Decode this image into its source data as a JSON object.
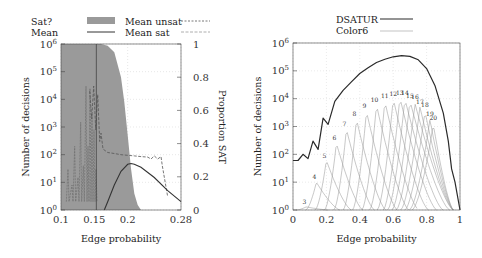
{
  "chart_data": [
    {
      "type": "area",
      "panel": "left",
      "title": "",
      "xlabel": "Edge probability",
      "ylabel": "Number of decisions",
      "ylabel_right": "Proportion SAT",
      "x_ticks": [
        "0.1",
        "0.15",
        "0.2",
        "0.28"
      ],
      "x_tick_values": [
        0.1,
        0.15,
        0.2,
        0.28
      ],
      "xlim": [
        0.1,
        0.28
      ],
      "y_ticks": [
        "10^0",
        "10^1",
        "10^2",
        "10^3",
        "10^4",
        "10^5",
        "10^6"
      ],
      "y_scale": "log",
      "ylim": [
        1,
        1000000
      ],
      "y_right_ticks": [
        "0",
        "0.2",
        "0.4",
        "0.6",
        "0.8",
        "1"
      ],
      "y_right_lim": [
        0,
        1
      ],
      "grid": true,
      "legend": {
        "position": "top",
        "entries": [
          {
            "label": "Sat?",
            "style": "filled-gray-area",
            "axis": "right"
          },
          {
            "label": "Mean",
            "style": "solid-dark"
          },
          {
            "label": "Mean unsat",
            "style": "dashed-dark"
          },
          {
            "label": "Mean sat",
            "style": "dashed-light"
          }
        ]
      },
      "series": [
        {
          "name": "Sat?",
          "axis": "right",
          "x": [
            0.1,
            0.16,
            0.17,
            0.18,
            0.19,
            0.195,
            0.2,
            0.205,
            0.21,
            0.215,
            0.22,
            0.28
          ],
          "values": [
            1.0,
            1.0,
            0.99,
            0.95,
            0.8,
            0.65,
            0.45,
            0.25,
            0.1,
            0.03,
            0.0,
            0.0
          ]
        },
        {
          "name": "Mean",
          "x": [
            0.165,
            0.17,
            0.18,
            0.19,
            0.2,
            0.205,
            0.21,
            0.22,
            0.24,
            0.26,
            0.28
          ],
          "values": [
            1,
            2,
            8,
            25,
            45,
            48,
            45,
            35,
            15,
            5,
            2
          ]
        },
        {
          "name": "Mean unsat",
          "x": [
            0.14,
            0.145,
            0.15,
            0.155,
            0.16,
            0.17,
            0.19,
            0.21,
            0.24,
            0.255,
            0.26
          ],
          "values": [
            20000,
            3000,
            25000,
            500,
            150,
            100,
            80,
            60,
            50,
            40,
            3
          ]
        },
        {
          "name": "Mean sat",
          "x": [
            0.11,
            0.12,
            0.13,
            0.14,
            0.15,
            0.155
          ],
          "values": [
            10,
            100,
            1000,
            20000,
            1000000,
            1
          ]
        }
      ]
    },
    {
      "type": "line",
      "panel": "right",
      "title": "",
      "xlabel": "Edge probability",
      "ylabel": "Number of decisions",
      "x_ticks": [
        "0",
        "0.2",
        "0.4",
        "0.6",
        "0.8",
        "1"
      ],
      "x_tick_values": [
        0,
        0.2,
        0.4,
        0.6,
        0.8,
        1
      ],
      "xlim": [
        0,
        1
      ],
      "y_ticks": [
        "10^0",
        "10^1",
        "10^2",
        "10^3",
        "10^4",
        "10^5",
        "10^6"
      ],
      "y_scale": "log",
      "ylim": [
        1,
        1000000
      ],
      "grid": true,
      "legend": {
        "position": "top",
        "entries": [
          {
            "label": "DSATUR",
            "style": "solid-dark"
          },
          {
            "label": "Color6",
            "style": "solid-light"
          }
        ]
      },
      "series": [
        {
          "name": "DSATUR",
          "x": [
            0,
            0.03,
            0.06,
            0.09,
            0.12,
            0.15,
            0.18,
            0.21,
            0.25,
            0.3,
            0.35,
            0.4,
            0.45,
            0.5,
            0.55,
            0.6,
            0.65,
            0.7,
            0.75,
            0.8,
            0.85,
            0.9,
            0.93,
            0.95,
            0.97,
            1.0
          ],
          "values": [
            60,
            60,
            100,
            70,
            300,
            150,
            2000,
            1200,
            8000,
            20000,
            40000,
            80000,
            130000,
            200000,
            260000,
            320000,
            350000,
            330000,
            250000,
            120000,
            30000,
            3000,
            300,
            30,
            10,
            1
          ]
        }
      ],
      "color_peaks": {
        "series_name": "Color6",
        "labels": [
          "3",
          "4",
          "5",
          "6",
          "7",
          "8",
          "9",
          "10",
          "11",
          "12",
          "13",
          "14",
          "15",
          "16",
          "17",
          "18",
          "19",
          "20"
        ],
        "peak_x": [
          0.08,
          0.14,
          0.2,
          0.26,
          0.32,
          0.38,
          0.44,
          0.5,
          0.55,
          0.6,
          0.64,
          0.67,
          0.7,
          0.73,
          0.76,
          0.79,
          0.82,
          0.84
        ],
        "peak_values": [
          1.3,
          10,
          60,
          250,
          800,
          1800,
          3500,
          6000,
          8000,
          10000,
          11000,
          10000,
          8500,
          7000,
          5000,
          3500,
          1800,
          1200
        ]
      }
    }
  ]
}
